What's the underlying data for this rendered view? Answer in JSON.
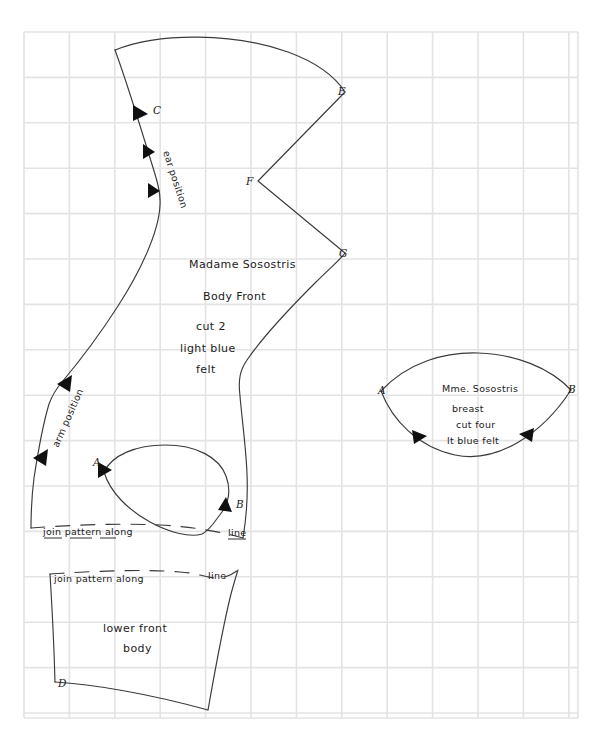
{
  "document": {
    "kind": "hand-drawn sewing pattern sheet",
    "background_color": "#ffffff",
    "grid_color": "#e3e3e5",
    "ink_color": "#3a3a3c",
    "text_color": "#1b1b1b"
  },
  "grid": {
    "origin_x": 24,
    "origin_y": 32,
    "spacing": 45.4,
    "columns": 13,
    "rows": 16,
    "right_edge": 578,
    "bottom_edge": 718
  },
  "pieces": {
    "body_front": {
      "name": "body-front-piece",
      "labels": {
        "line1": "Madame Sosostris",
        "line2": "Body  Front",
        "line3": "cut  2",
        "line4": "light  blue",
        "line5": "felt"
      },
      "notations": {
        "ear_position": "ear position",
        "arm_position": "arm position",
        "join_note_prefix": "join pattern along",
        "join_note_suffix": "line"
      },
      "markers": [
        {
          "id": "C",
          "x": 148,
          "y": 110
        },
        {
          "id": "E",
          "x": 344,
          "y": 91
        },
        {
          "id": "F",
          "x": 252,
          "y": 181
        },
        {
          "id": "G",
          "x": 345,
          "y": 253
        },
        {
          "id": "A",
          "x": 98,
          "y": 468
        },
        {
          "id": "B",
          "x": 238,
          "y": 505
        }
      ]
    },
    "lower_front_body": {
      "name": "lower-front-body-piece",
      "labels": {
        "line1": "lower front",
        "line2": "body"
      },
      "notations": {
        "join_note_prefix": "join pattern along",
        "join_note_suffix": "line"
      },
      "markers": [
        {
          "id": "D",
          "x": 60,
          "y": 683
        }
      ]
    },
    "breast": {
      "name": "breast-piece",
      "labels": {
        "line1": "Mme. Sosostris",
        "line2": "breast",
        "line3": "cut  four",
        "line4": "lt blue  felt"
      },
      "markers": [
        {
          "id": "A",
          "x": 381,
          "y": 391
        },
        {
          "id": "B",
          "x": 570,
          "y": 390
        }
      ]
    }
  }
}
